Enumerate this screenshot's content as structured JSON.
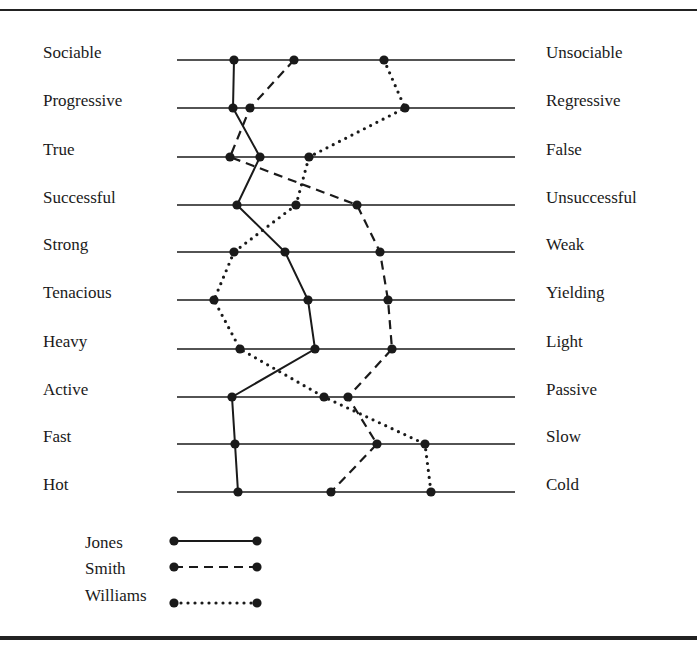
{
  "chart_data": {
    "type": "line",
    "title": "",
    "subtitle": "Semantic differential profiles",
    "orientation": "horizontal-scales",
    "scales": [
      {
        "left": "Sociable",
        "right": "Unsociable"
      },
      {
        "left": "Progressive",
        "right": "Regressive"
      },
      {
        "left": "True",
        "right": "False"
      },
      {
        "left": "Successful",
        "right": "Unsuccessful"
      },
      {
        "left": "Strong",
        "right": "Weak"
      },
      {
        "left": "Tenacious",
        "right": "Yielding"
      },
      {
        "left": "Heavy",
        "right": "Light"
      },
      {
        "left": "Active",
        "right": "Passive"
      },
      {
        "left": "Fast",
        "right": "Slow"
      },
      {
        "left": "Hot",
        "right": "Cold"
      }
    ],
    "x_range_px": [
      177,
      515
    ],
    "row_y_px": [
      60,
      108,
      157,
      205,
      252,
      300,
      349,
      397,
      444,
      492
    ],
    "series": [
      {
        "name": "Jones",
        "style": "solid",
        "x_px": [
          234,
          233,
          260,
          237,
          285,
          308,
          315,
          232,
          235,
          238
        ]
      },
      {
        "name": "Smith",
        "style": "dashed",
        "x_px": [
          294,
          250,
          230,
          357,
          380,
          388,
          392,
          348,
          377,
          331
        ]
      },
      {
        "name": "Williams",
        "style": "dotted",
        "x_px": [
          384,
          405,
          309,
          296,
          234,
          214,
          240,
          324,
          425,
          431
        ]
      }
    ],
    "legend_position": "bottom-left",
    "grid": false
  },
  "legend": [
    {
      "label": "Jones",
      "style": "solid"
    },
    {
      "label": "Smith",
      "style": "dashed"
    },
    {
      "label": "Williams",
      "style": "dotted"
    }
  ],
  "colors": {
    "ink": "#1a1a1a",
    "background": "#ffffff"
  }
}
